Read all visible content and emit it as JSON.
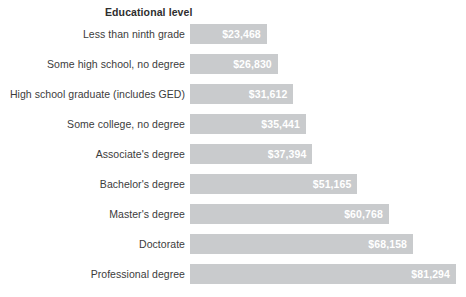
{
  "chart_data": {
    "type": "bar",
    "orientation": "horizontal",
    "title": "Educational level",
    "xlabel": "",
    "ylabel": "",
    "grid": false,
    "legend": null,
    "xlim": [
      0,
      81294
    ],
    "categories": [
      "Less than ninth grade",
      "Some high school, no degree",
      "High school graduate (includes GED)",
      "Some college, no degree",
      "Associate's degree",
      "Bachelor's degree",
      "Master's degree",
      "Doctorate",
      "Professional degree"
    ],
    "values": [
      23468,
      26830,
      31612,
      35441,
      37394,
      51165,
      60768,
      68158,
      81294
    ],
    "value_labels": [
      "$23,468",
      "$26,830",
      "$31,612",
      "$35,441",
      "$37,394",
      "$51,165",
      "$60,768",
      "$68,158",
      "$81,294"
    ],
    "bar_color": "#c9cbcd",
    "value_label_color": "#ffffff",
    "category_label_color": "#3c3c3c",
    "background_color": "#ffffff"
  }
}
